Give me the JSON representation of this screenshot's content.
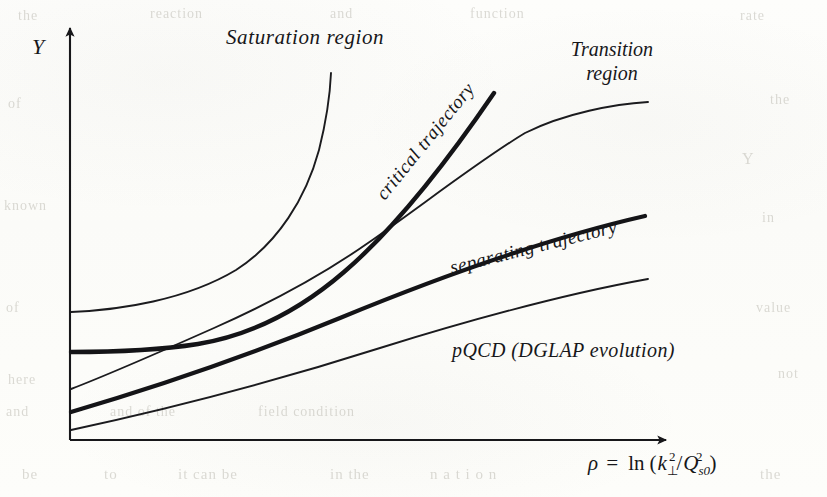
{
  "figure": {
    "kind": "schematic-phase-diagram",
    "axes": {
      "y_label": "Y",
      "x_label_parts": {
        "rho": "ρ",
        "equals": "=",
        "ln": "ln",
        "open_paren": "(",
        "k": "k",
        "k_sub": "⊥",
        "k_sup": "2",
        "slash": "/",
        "Q": "Q",
        "Q_sub": "s0",
        "Q_sup": "2",
        "close_paren": ")"
      },
      "x_label_plain": "ρ = ln (k⊥²/Q²s0)",
      "origin": {
        "x": 70,
        "y": 440
      },
      "x_arrow_tip": {
        "x": 672,
        "y": 440
      },
      "y_arrow_tip": {
        "x": 70,
        "y": 24
      }
    },
    "region_labels": [
      {
        "id": "saturation-region",
        "text": "Saturation region",
        "x": 226,
        "y": 44,
        "rotation": 0,
        "font_size": 21
      },
      {
        "id": "transition-region",
        "line1": "Transition",
        "line2": "region",
        "x": 612,
        "y": 56,
        "rotation": 0,
        "font_size": 20
      },
      {
        "id": "pqcd-region",
        "text": "pQCD  (DGLAP evolution)",
        "x": 452,
        "y": 357,
        "rotation": 0,
        "font_size": 20
      }
    ],
    "curve_labels": [
      {
        "id": "critical-trajectory",
        "text": "critical trajectory",
        "x": 430,
        "y": 145,
        "rotation": -51,
        "font_size": 19
      },
      {
        "id": "separating-trajectory",
        "text": "separating trajectory",
        "x": 535,
        "y": 253,
        "rotation": -14,
        "font_size": 19
      }
    ],
    "curves": [
      {
        "id": "saturation-boundary",
        "name": "saturation-boundary-curve",
        "style": "thin",
        "stroke_width": 1.9,
        "color": "#1b1b1e",
        "path": "M 71 312 C 120 310 186 300 236 270 C 278 243 306 198 319 150 C 326 122 330 96 331 73",
        "start": {
          "x": 71,
          "y": 312
        },
        "end": {
          "x": 331,
          "y": 73
        }
      },
      {
        "id": "critical-trajectory",
        "name": "critical-trajectory-curve",
        "style": "thick",
        "stroke_width": 4.4,
        "color": "#141417",
        "path": "M 71 352 C 118 352 160 350 198 344 C 252 335 300 310 344 272 C 392 231 440 172 494 93",
        "start": {
          "x": 71,
          "y": 352
        },
        "end": {
          "x": 494,
          "y": 93
        }
      },
      {
        "id": "transition-boundary",
        "name": "transition-boundary-curve",
        "style": "thin",
        "stroke_width": 1.9,
        "color": "#1b1b1e",
        "path": "M 71 389 C 110 374 160 352 214 328 C 268 304 318 278 368 243 C 420 207 480 160 525 133 C 565 113 615 104 648 102",
        "start": {
          "x": 71,
          "y": 389
        },
        "end": {
          "x": 648,
          "y": 102
        }
      },
      {
        "id": "separating-trajectory",
        "name": "separating-trajectory-curve",
        "style": "thick",
        "stroke_width": 4.2,
        "color": "#141417",
        "path": "M 71 412 C 150 389 250 355 340 318 C 430 281 540 240 645 216",
        "start": {
          "x": 71,
          "y": 412
        },
        "end": {
          "x": 645,
          "y": 216
        }
      },
      {
        "id": "pqcd-dglap",
        "name": "pqcd-dglap-curve",
        "style": "thin",
        "stroke_width": 1.9,
        "color": "#1b1b1e",
        "path": "M 71 430 C 160 411 270 383 380 348 C 470 320 570 293 648 279",
        "start": {
          "x": 71,
          "y": 430
        },
        "end": {
          "x": 648,
          "y": 279
        }
      }
    ],
    "background_bleed": [
      {
        "text": "the",
        "x": 18,
        "y": 8,
        "size": 14
      },
      {
        "text": "reaction",
        "x": 150,
        "y": 6,
        "size": 14
      },
      {
        "text": "and",
        "x": 330,
        "y": 6,
        "size": 14
      },
      {
        "text": "function",
        "x": 470,
        "y": 6,
        "size": 14
      },
      {
        "text": "rate",
        "x": 740,
        "y": 8,
        "size": 14
      },
      {
        "text": "of",
        "x": 8,
        "y": 96,
        "size": 14
      },
      {
        "text": "the",
        "x": 770,
        "y": 92,
        "size": 14
      },
      {
        "text": "Y",
        "x": 742,
        "y": 150,
        "size": 16
      },
      {
        "text": "known",
        "x": 4,
        "y": 198,
        "size": 14
      },
      {
        "text": "in",
        "x": 762,
        "y": 210,
        "size": 14
      },
      {
        "text": "of",
        "x": 6,
        "y": 300,
        "size": 14
      },
      {
        "text": "value",
        "x": 756,
        "y": 300,
        "size": 14
      },
      {
        "text": "here",
        "x": 8,
        "y": 372,
        "size": 14
      },
      {
        "text": "not",
        "x": 778,
        "y": 366,
        "size": 14
      },
      {
        "text": "and",
        "x": 6,
        "y": 404,
        "size": 14
      },
      {
        "text": "and of the",
        "x": 110,
        "y": 404,
        "size": 14
      },
      {
        "text": "field condition",
        "x": 258,
        "y": 404,
        "size": 14
      },
      {
        "text": "be",
        "x": 22,
        "y": 466,
        "size": 15
      },
      {
        "text": "to",
        "x": 104,
        "y": 466,
        "size": 15
      },
      {
        "text": "it can be",
        "x": 178,
        "y": 466,
        "size": 15
      },
      {
        "text": "in the",
        "x": 330,
        "y": 466,
        "size": 15
      },
      {
        "text": "n  a  t  i  o  n",
        "x": 430,
        "y": 466,
        "size": 15
      },
      {
        "text": "the",
        "x": 760,
        "y": 466,
        "size": 15
      }
    ]
  }
}
